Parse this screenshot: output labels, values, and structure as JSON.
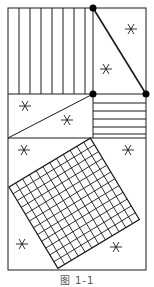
{
  "figure": {
    "caption": "图 1-1",
    "stroke_color": "#1a1a1a",
    "background": "#ffffff",
    "outer_rect": {
      "x": 8,
      "y": 8,
      "w": 138,
      "h": 262
    },
    "regions": [
      {
        "name": "top-left",
        "fill": "vertical-hatch"
      },
      {
        "name": "top-right",
        "fill": "triangle-with-stars",
        "stars": 2
      },
      {
        "name": "middle-left",
        "fill": "diagonal-split-with-stars",
        "stars": 2
      },
      {
        "name": "middle-right",
        "fill": "horizontal-hatch"
      },
      {
        "name": "bottom",
        "fill": "rotated-grid-square",
        "stars": 4
      }
    ],
    "points": [
      {
        "label": "top-divider-point",
        "x": 93,
        "y": 8
      },
      {
        "label": "middle-divider-point",
        "x": 93,
        "y": 94
      },
      {
        "label": "right-edge-point",
        "x": 146,
        "y": 94
      }
    ]
  }
}
